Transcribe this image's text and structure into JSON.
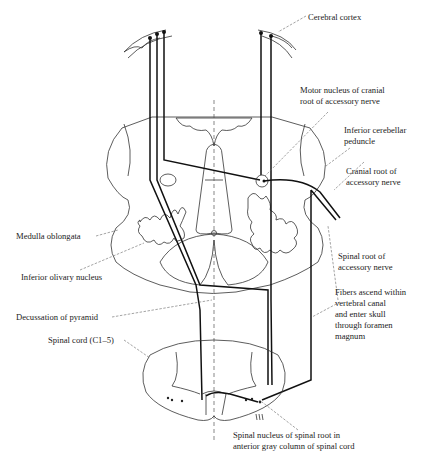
{
  "labels": {
    "cerebral_cortex": "Cerebral cortex",
    "motor_nucleus_1": "Motor nucleus of cranial",
    "motor_nucleus_2": "root of accessory nerve",
    "inf_cereb_1": "Inferior cerebellar",
    "inf_cereb_2": "peduncle",
    "cranial_root_1": "Cranial root of",
    "cranial_root_2": "accessory nerve",
    "medulla": "Medulla oblongata",
    "spinal_root_1": "Spinal root of",
    "spinal_root_2": "accessory nerve",
    "inf_olivary": "Inferior olivary nucleus",
    "fibers_1": "Fibers ascend within",
    "fibers_2": "vertebral canal",
    "fibers_3": "and enter skull",
    "fibers_4": "through foramen",
    "fibers_5": "magnum",
    "decussation": "Decussation of pyramid",
    "spinal_cord": "Spinal cord (C1–5)",
    "spinal_nucleus_1": "Spinal nucleus of spinal root in",
    "spinal_nucleus_2": "anterior gray column of spinal cord"
  }
}
